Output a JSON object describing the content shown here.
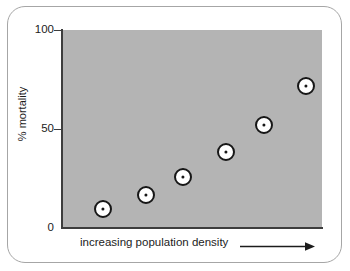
{
  "figure": {
    "frame_color": "#a6a6a6",
    "plot_background": "#b4b4b4",
    "axis_color": "#3d3d3d",
    "marker_fill": "#ffffff",
    "marker_stroke": "#171717"
  },
  "chart_data": {
    "type": "scatter",
    "title": "",
    "xlabel": "increasing population density",
    "ylabel": "% mortality",
    "xlim": [
      0,
      1
    ],
    "ylim": [
      0,
      100
    ],
    "grid": false,
    "legend": "none",
    "x_axis_has_ticks": false,
    "x_axis_arrow": true,
    "y_ticks": [
      {
        "value": 100,
        "label": "100"
      },
      {
        "value": 50,
        "label": "50"
      },
      {
        "value": 0,
        "label": "0"
      }
    ],
    "points": [
      {
        "x": 0.158,
        "y": 9.6
      },
      {
        "x": 0.323,
        "y": 16.7
      },
      {
        "x": 0.465,
        "y": 25.8
      },
      {
        "x": 0.631,
        "y": 38.4
      },
      {
        "x": 0.777,
        "y": 52.0
      },
      {
        "x": 0.938,
        "y": 71.7
      }
    ],
    "series": [
      {
        "name": "mortality vs population density",
        "values": [
          9.6,
          16.7,
          25.8,
          38.4,
          52.0,
          71.7
        ]
      }
    ],
    "annotations": []
  }
}
